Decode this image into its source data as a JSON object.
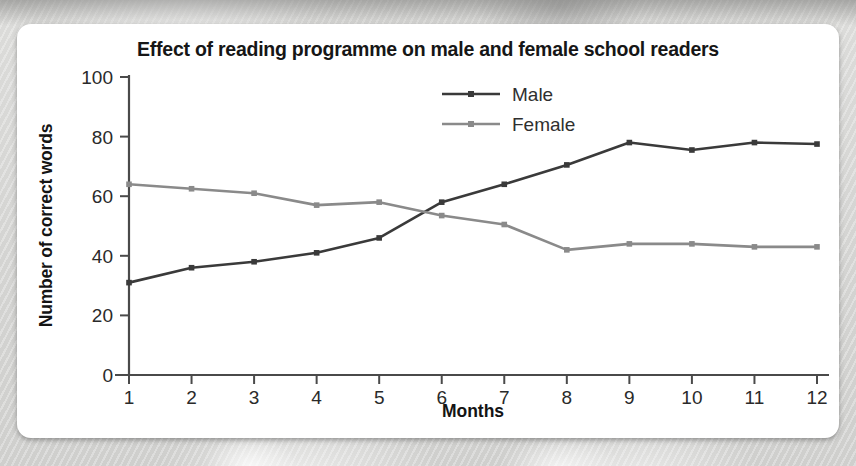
{
  "chart_data": {
    "type": "line",
    "title": "Effect of reading programme on male and female school readers",
    "xlabel": "Months",
    "ylabel": "Number of correct words",
    "categories": [
      "1",
      "2",
      "3",
      "4",
      "5",
      "6",
      "7",
      "8",
      "9",
      "10",
      "11",
      "12"
    ],
    "x": [
      1,
      2,
      3,
      4,
      5,
      6,
      7,
      8,
      9,
      10,
      11,
      12
    ],
    "ylim": [
      0,
      100
    ],
    "yticks": [
      0,
      20,
      40,
      60,
      80,
      100
    ],
    "ytick_labels": [
      "0",
      "20",
      "40",
      "60",
      "80",
      "100"
    ],
    "xlim": [
      1,
      12
    ],
    "grid": false,
    "legend_position": "top-center",
    "series": [
      {
        "name": "Male",
        "color": "#3a3a3a",
        "marker": "square",
        "values": [
          31,
          36,
          38,
          41,
          46,
          58,
          64,
          70.5,
          78,
          75.5,
          78,
          77.5
        ]
      },
      {
        "name": "Female",
        "color": "#8a8a8a",
        "marker": "square",
        "values": [
          64,
          62.5,
          61,
          57,
          58,
          53.5,
          50.5,
          42,
          44,
          44,
          43,
          43
        ]
      }
    ]
  },
  "colors": {
    "panel_background": "#ffffff",
    "page_background": "#d8d8d6",
    "axis": "#4a4a4a",
    "male": "#3a3a3a",
    "female": "#8a8a8a",
    "title_text": "#161616"
  }
}
